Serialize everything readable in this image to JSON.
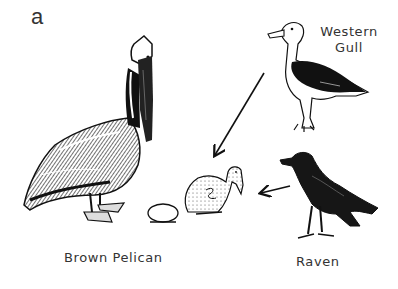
{
  "figure": {
    "panel_label": "a",
    "organisms": {
      "pelican": {
        "name": "Brown Pelican",
        "icon": "pelican-illustration"
      },
      "gull": {
        "name_line1": "Western",
        "name_line2": "Gull",
        "icon": "gull-illustration"
      },
      "raven": {
        "name": "Raven",
        "icon": "raven-illustration"
      },
      "chick": {
        "icon": "pelican-chick-illustration"
      },
      "egg": {
        "icon": "egg-illustration"
      }
    },
    "arrows": [
      {
        "from": "Western Gull",
        "to": "pelican chick"
      },
      {
        "from": "Raven",
        "to": "pelican chick"
      }
    ],
    "colors": {
      "ink": "#111111",
      "background": "#ffffff",
      "text": "#333333"
    }
  }
}
